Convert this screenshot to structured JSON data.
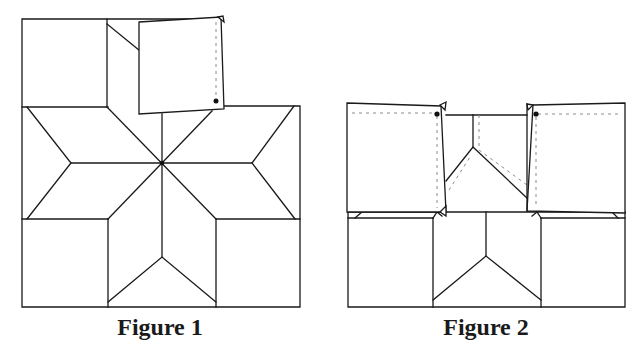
{
  "figures": [
    {
      "id": "figure1",
      "caption": "Figure 1",
      "description": "Eight-pointed star quilt block with top-center square folded down as a flap"
    },
    {
      "id": "figure2",
      "caption": "Figure 2",
      "description": "Quilt block with left and right squares folded over as flaps, revealing seam lines"
    }
  ],
  "colors": {
    "line": "#1a1a1a",
    "dashed": "#8a8a8a",
    "background": "#ffffff"
  }
}
